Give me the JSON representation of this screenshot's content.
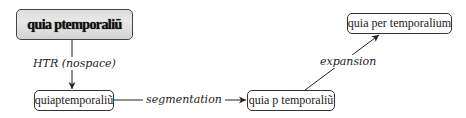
{
  "diagram": {
    "nodes": [
      {
        "id": "scan",
        "text": "quia ptemporaliũ",
        "type": "image-crop"
      },
      {
        "id": "htr_output",
        "text": "quiaptemporaliũ"
      },
      {
        "id": "segmented",
        "text": "quia p temporaliũ"
      },
      {
        "id": "expanded",
        "text": "quia per temporalium"
      }
    ],
    "edges": [
      {
        "from": "scan",
        "to": "htr_output",
        "label": "HTR (nospace)"
      },
      {
        "from": "htr_output",
        "to": "segmented",
        "label": "segmentation"
      },
      {
        "from": "segmented",
        "to": "expanded",
        "label": "expansion"
      }
    ]
  }
}
